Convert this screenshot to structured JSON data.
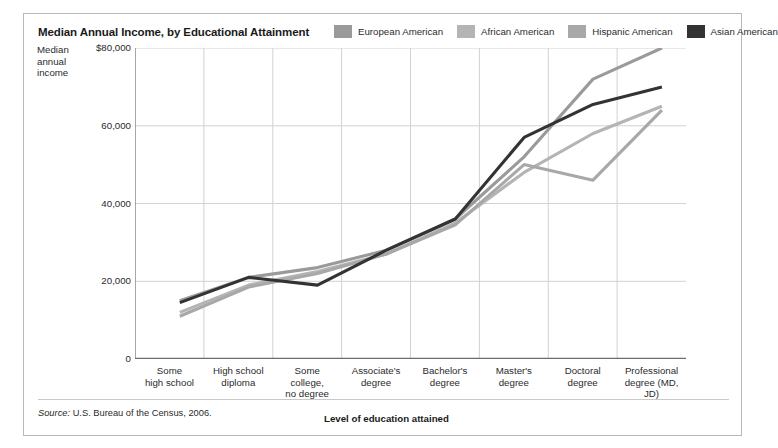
{
  "title": "Median Annual Income, by Educational Attainment",
  "axis_title_y": "Median annual income",
  "axis_title_x": "Level of education attained",
  "source_prefix": "Source:",
  "source_text": "U.S. Bureau of the Census, 2006.",
  "legend": {
    "position": "top-right",
    "items": [
      {
        "label": "European American",
        "color": "#9a9a9a"
      },
      {
        "label": "African American",
        "color": "#b4b4b4"
      },
      {
        "label": "Hispanic American",
        "color": "#a8a8a8"
      },
      {
        "label": "Asian American",
        "color": "#333333"
      }
    ]
  },
  "chart_data": {
    "type": "line",
    "title": "Median Annual Income, by Educational Attainment",
    "xlabel": "Level of education attained",
    "ylabel": "Median annual income",
    "ylim": [
      0,
      80000
    ],
    "yticks": [
      0,
      20000,
      40000,
      60000,
      80000
    ],
    "ytick_labels": [
      "0",
      "20,000",
      "40,000",
      "60,000",
      "$80,000"
    ],
    "grid": true,
    "categories": [
      "Some high school",
      "High school diploma",
      "Some college, no degree",
      "Associate's degree",
      "Bachelor's degree",
      "Master's degree",
      "Doctoral degree",
      "Professional degree (MD, JD)"
    ],
    "category_labels": [
      [
        "Some",
        "high school"
      ],
      [
        "High school",
        "diploma"
      ],
      [
        "Some",
        "college,",
        "no degree"
      ],
      [
        "Associate's",
        "degree"
      ],
      [
        "Bachelor's",
        "degree"
      ],
      [
        "Master's",
        "degree"
      ],
      [
        "Doctoral",
        "degree"
      ],
      [
        "Professional",
        "degree (MD,",
        "JD)"
      ]
    ],
    "series": [
      {
        "name": "European American",
        "color": "#9a9a9a",
        "values": [
          15000,
          21000,
          23500,
          28000,
          36000,
          52000,
          72000,
          80000
        ]
      },
      {
        "name": "African American",
        "color": "#b4b4b4",
        "values": [
          12000,
          19000,
          22500,
          27000,
          35000,
          48000,
          58000,
          65000
        ]
      },
      {
        "name": "Hispanic American",
        "color": "#a8a8a8",
        "values": [
          11000,
          18500,
          22000,
          27000,
          34500,
          50000,
          46000,
          64000
        ]
      },
      {
        "name": "Asian American",
        "color": "#333333",
        "values": [
          14500,
          21000,
          19000,
          28000,
          36000,
          57000,
          65500,
          70000
        ]
      }
    ]
  }
}
